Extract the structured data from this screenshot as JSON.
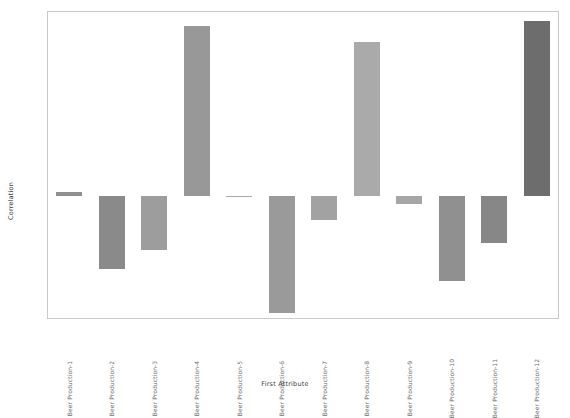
{
  "chart_data": {
    "type": "bar",
    "title": "",
    "xlabel": "First Attribute",
    "ylabel": "Correlation",
    "grid": false,
    "legend": null,
    "ylim": [
      -0.7,
      1.05
    ],
    "yticks": [
      1.0,
      0.9,
      0.8,
      0.7,
      0.6,
      0.5,
      0.4,
      0.3,
      0.2,
      0.1,
      0.0,
      -0.1,
      -0.2,
      -0.3,
      -0.4,
      -0.5,
      -0.6,
      -0.7
    ],
    "ytick_labels": [
      "1.0",
      "0.9",
      "0.8",
      "0.7",
      "0.6",
      "0.5",
      "0.4",
      "0.3",
      "0.2",
      "0.1",
      "0.0",
      "-0.1",
      "-0.2",
      "-0.3",
      "-0.4",
      "-0.5",
      "-0.6",
      "-0.7"
    ],
    "categories": [
      "Beer Production-1",
      "Beer Production-2",
      "Beer Production-3",
      "Beer Production-4",
      "Beer Production-5",
      "Beer Production-6",
      "Beer Production-7",
      "Beer Production-8",
      "Beer Production-9",
      "Beer Production-10",
      "Beer Production-11",
      "Beer Production-12"
    ],
    "values": [
      0.02,
      -0.42,
      -0.31,
      0.97,
      -0.01,
      -0.67,
      -0.14,
      0.88,
      -0.05,
      -0.49,
      -0.27,
      1.0
    ],
    "colors": [
      "#8f8f8f",
      "#8a8a8a",
      "#9d9d9d",
      "#989898",
      "#a8a8a8",
      "#9a9a9a",
      "#a2a2a2",
      "#aaaaaa",
      "#a6a6a6",
      "#909090",
      "#878787",
      "#6d6d6d"
    ]
  },
  "axes": {
    "frame_color": "#c9c9c9",
    "tick_color": "#bdbdbd",
    "tick_text_color": "#555555",
    "label_text_color": "#3b3b3b"
  },
  "background": "#ffffff"
}
